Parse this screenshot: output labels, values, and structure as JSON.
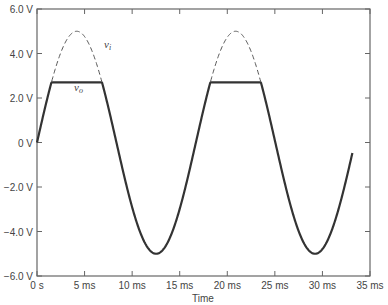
{
  "chart_data": {
    "type": "line",
    "title": "",
    "xlabel": "Time",
    "ylabel": "",
    "xlim": [
      0,
      35
    ],
    "ylim": [
      -6,
      6
    ],
    "x_unit": "ms",
    "x_ticks": [
      "0 s",
      "5 ms",
      "10 ms",
      "15 ms",
      "20 ms",
      "25 ms",
      "30 ms",
      "35 ms"
    ],
    "y_ticks": [
      "6.0 V",
      "4.0 V",
      "2.0 V",
      "0 V",
      "-2.0 V",
      "-4.0 V",
      "-6.0 V"
    ],
    "grid": false,
    "series": [
      {
        "name": "v_i",
        "style": "dashed",
        "description": "sine wave, amplitude 5.0 V, period ~16.7 ms",
        "amplitude": 5.0,
        "period_ms": 16.7
      },
      {
        "name": "v_o",
        "style": "solid",
        "description": "v_i clipped at ~2.7 V",
        "clip_level": 2.7
      }
    ]
  },
  "labels": {
    "vi": "v",
    "vi_sub": "i",
    "vo": "v",
    "vo_sub": "o"
  }
}
